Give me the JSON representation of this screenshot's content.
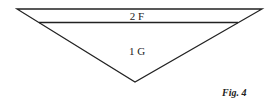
{
  "figure": {
    "caption": "Fig. 4",
    "shape": "inverted-triangle",
    "regions": [
      {
        "id": "upper-band",
        "label": "2 F"
      },
      {
        "id": "lower-triangle",
        "label": "1 G"
      }
    ],
    "colors": {
      "line": "#222222",
      "background": "#ffffff"
    }
  }
}
